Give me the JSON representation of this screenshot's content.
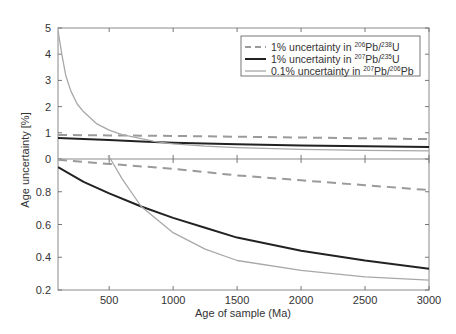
{
  "chart_data": {
    "type": "line",
    "layout": "two stacked panels sharing x-axis",
    "xlabel": "Age of sample (Ma)",
    "ylabel": "Age uncertainty [%]",
    "xlim": [
      100,
      3000
    ],
    "xticks": [
      500,
      1000,
      1500,
      2000,
      2500,
      3000
    ],
    "grid": false,
    "legend": {
      "position": "upper right of top panel",
      "entries": [
        {
          "style": "dashed",
          "color": "#9a9a9a",
          "label_prefix": "1% uncertainty in ",
          "iso1": "206",
          "el1": "Pb/",
          "iso2": "238",
          "el2": "U"
        },
        {
          "style": "solid-thick",
          "color": "#222222",
          "label_prefix": "1% uncertainty in ",
          "iso1": "207",
          "el1": "Pb/",
          "iso2": "235",
          "el2": "U"
        },
        {
          "style": "solid-thin",
          "color": "#a8a8a8",
          "label_prefix": "0.1% uncertainty in ",
          "iso1": "207",
          "el1": "Pb/",
          "iso2": "206",
          "el2": "Pb"
        }
      ]
    },
    "panels": [
      {
        "name": "top",
        "ylim": [
          0,
          5
        ],
        "yticks": [
          "0",
          "1",
          "2",
          "3",
          "4",
          "5"
        ],
        "series": [
          {
            "name": "1% uncertainty in 206Pb/238U",
            "style": "dashed",
            "x": [
              100,
              500,
              1000,
              1500,
              2000,
              2500,
              3000
            ],
            "y": [
              0.92,
              0.9,
              0.88,
              0.85,
              0.82,
              0.79,
              0.76
            ]
          },
          {
            "name": "1% uncertainty in 207Pb/235U",
            "style": "solid-thick",
            "x": [
              100,
              500,
              750,
              1000,
              1500,
              2000,
              2500,
              3000
            ],
            "y": [
              0.8,
              0.72,
              0.67,
              0.62,
              0.56,
              0.52,
              0.49,
              0.46
            ]
          },
          {
            "name": "0.1% uncertainty in 207Pb/206Pb",
            "style": "solid-thin",
            "x": [
              100,
              130,
              160,
              200,
              250,
              300,
              400,
              500,
              600,
              750,
              850,
              1000,
              1250,
              1500,
              2000,
              2500,
              3000
            ],
            "y": [
              4.9,
              4.0,
              3.2,
              2.6,
              2.1,
              1.8,
              1.35,
              1.1,
              0.93,
              0.78,
              0.67,
              0.58,
              0.49,
              0.43,
              0.37,
              0.33,
              0.31
            ]
          }
        ]
      },
      {
        "name": "bottom",
        "ylim": [
          0.2,
          1.0
        ],
        "yticks": [
          "0.2",
          "0.4",
          "0.6",
          "0.8"
        ],
        "series": [
          {
            "name": "1% uncertainty in 206Pb/238U",
            "style": "dashed",
            "x": [
              100,
              500,
              1000,
              1500,
              2000,
              2500,
              3000
            ],
            "y": [
              0.995,
              0.97,
              0.94,
              0.9,
              0.87,
              0.84,
              0.81
            ]
          },
          {
            "name": "1% uncertainty in 207Pb/235U",
            "style": "solid-thick",
            "x": [
              100,
              300,
              500,
              750,
              1000,
              1250,
              1500,
              2000,
              2500,
              3000
            ],
            "y": [
              0.95,
              0.86,
              0.79,
              0.71,
              0.64,
              0.58,
              0.52,
              0.44,
              0.38,
              0.33
            ]
          },
          {
            "name": "0.1% uncertainty in 207Pb/206Pb",
            "style": "solid-thin",
            "x": [
              490,
              510,
              600,
              750,
              1000,
              1250,
              1500,
              2000,
              2500,
              3000
            ],
            "y": [
              1.02,
              1.0,
              0.88,
              0.71,
              0.55,
              0.45,
              0.38,
              0.32,
              0.28,
              0.26
            ]
          }
        ]
      }
    ]
  }
}
